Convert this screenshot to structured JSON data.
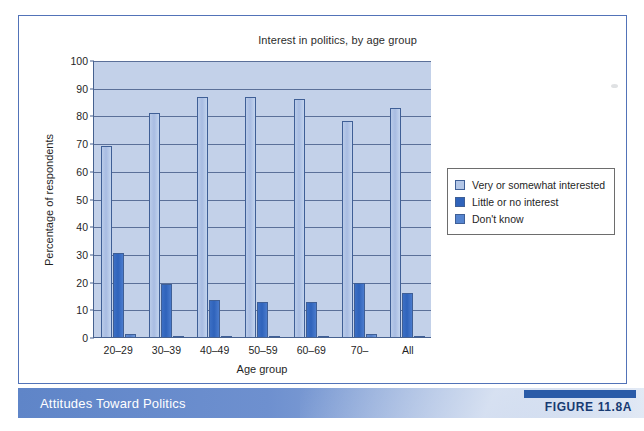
{
  "figure": {
    "banner_title": "Attitudes Toward Politics",
    "figure_label": "FIGURE 11.8A",
    "source_line": ""
  },
  "chart_data": {
    "type": "bar",
    "title": "Interest in politics, by age group",
    "xlabel": "Age group",
    "ylabel": "Percentage of respondents",
    "ylim": [
      0,
      100
    ],
    "yticks": [
      0,
      10,
      20,
      30,
      40,
      50,
      60,
      70,
      80,
      90,
      100
    ],
    "grid": true,
    "legend_position": "right",
    "categories": [
      "20–29",
      "30–39",
      "40–49",
      "50–59",
      "60–69",
      "70–",
      "All"
    ],
    "series": [
      {
        "name": "Very or somewhat interested",
        "color": "#a8bce2",
        "values": [
          69,
          81,
          86.5,
          86.5,
          86,
          78,
          82.5
        ]
      },
      {
        "name": "Little or no interest",
        "color": "#2f63bb",
        "values": [
          30.5,
          19,
          13.5,
          12.5,
          12.5,
          19.5,
          16
        ]
      },
      {
        "name": "Don't know",
        "color": "#5584cf",
        "values": [
          1,
          0.3,
          0.3,
          0.5,
          0.5,
          1.2,
          0.5
        ]
      }
    ]
  }
}
